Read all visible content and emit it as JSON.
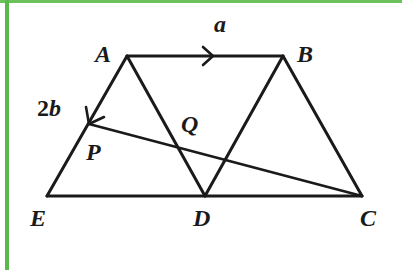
{
  "figure": {
    "type": "geometry",
    "points": {
      "A": {
        "label": "A",
        "x": 127,
        "y": 56
      },
      "B": {
        "label": "B",
        "x": 283,
        "y": 56
      },
      "C": {
        "label": "C",
        "x": 362,
        "y": 196
      },
      "D": {
        "label": "D",
        "x": 205,
        "y": 196
      },
      "E": {
        "label": "E",
        "x": 47,
        "y": 196
      },
      "P": {
        "label": "P",
        "x": 89,
        "y": 124
      },
      "Q": {
        "label": "Q",
        "x": 177,
        "y": 147
      }
    },
    "segments": [
      "AB",
      "AE",
      "AD",
      "BD",
      "BC",
      "EC",
      "PC"
    ],
    "vectors": [
      {
        "from": "A",
        "to": "B",
        "label": "a"
      },
      {
        "from": "A",
        "to": "E",
        "label_coef": "2",
        "label_vec": "b"
      }
    ],
    "colors": {
      "line": "#1a1a1a",
      "frame": "#5cb84a",
      "background": "#ffffff"
    }
  }
}
